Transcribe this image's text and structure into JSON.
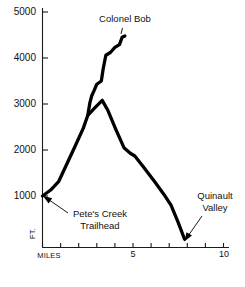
{
  "chart_data": {
    "type": "line",
    "title": "",
    "xlabel": "MILES",
    "ylabel": "FT.",
    "xlim": [
      0,
      10
    ],
    "ylim": [
      0,
      5000
    ],
    "grid": false,
    "legend": "none",
    "x_ticks": [
      0,
      1,
      2,
      3,
      4,
      5,
      6,
      7,
      8,
      9,
      10
    ],
    "x_tick_labels": [
      "MILES",
      "",
      "",
      "",
      "",
      "5",
      "",
      "",
      "",
      "",
      "10"
    ],
    "y_ticks": [
      1000,
      2000,
      3000,
      4000,
      5000
    ],
    "y_tick_labels": [
      "1000",
      "2000",
      "3000",
      "4000",
      "5000"
    ],
    "series": [
      {
        "name": "Main trail",
        "points": [
          [
            0.0,
            1000
          ],
          [
            0.45,
            1130
          ],
          [
            0.9,
            1320
          ],
          [
            1.35,
            1700
          ],
          [
            1.8,
            2080
          ],
          [
            2.25,
            2470
          ],
          [
            2.5,
            2750
          ],
          [
            2.9,
            2920
          ],
          [
            3.3,
            3080
          ],
          [
            3.6,
            2870
          ],
          [
            4.05,
            2450
          ],
          [
            4.5,
            2050
          ],
          [
            4.85,
            1930
          ],
          [
            5.1,
            1870
          ],
          [
            5.6,
            1620
          ],
          [
            6.2,
            1310
          ],
          [
            6.7,
            1040
          ],
          [
            7.1,
            800
          ],
          [
            7.5,
            420
          ],
          [
            7.85,
            60
          ]
        ]
      },
      {
        "name": "Colonel Bob",
        "points": [
          [
            2.5,
            2750
          ],
          [
            2.62,
            3030
          ],
          [
            2.72,
            3180
          ],
          [
            2.85,
            3290
          ],
          [
            3.0,
            3430
          ],
          [
            3.25,
            3500
          ],
          [
            3.35,
            3760
          ],
          [
            3.5,
            4060
          ],
          [
            3.75,
            4120
          ],
          [
            4.0,
            4230
          ],
          [
            4.25,
            4290
          ],
          [
            4.4,
            4450
          ],
          [
            4.55,
            4480
          ]
        ]
      }
    ],
    "annotations": [
      {
        "id": "colonel-bob",
        "text": "Colonel Bob",
        "line1": "Colonel Bob",
        "line2": ""
      },
      {
        "id": "petes-creek",
        "text": "Pete's Creek Trailhead",
        "line1": "Pete's Creek",
        "line2": "Trailhead"
      },
      {
        "id": "quinault-valley",
        "text": "Quinault Valley",
        "line1": "Quinault",
        "line2": "Valley"
      }
    ],
    "colors": {
      "line": "#000000",
      "axis": "#1a1a1a",
      "background": "#ffffff"
    }
  },
  "axis": {
    "y_labels": [
      "5000",
      "4000",
      "3000",
      "2000",
      "1000"
    ],
    "x_origin_label": "MILES",
    "x_mid_label": "5",
    "x_end_label": "10",
    "y_unit": "FT."
  },
  "annotations": {
    "colonel_bob": "Colonel Bob",
    "petes_creek_line1": "Pete's Creek",
    "petes_creek_line2": "Trailhead",
    "quinault_line1": "Quinault",
    "quinault_line2": "Valley"
  }
}
